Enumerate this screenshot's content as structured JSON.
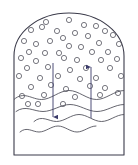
{
  "figure": {
    "title": "",
    "caption": "",
    "background_color": "#ffffff",
    "stroke_color": "#3b3b4a",
    "bubble_stroke_color": "#55555f",
    "wave_stroke_color": "#4a4a55",
    "arrow_color": "#3a3a6a"
  },
  "vessel": {
    "name": "vessel-outline",
    "label": "",
    "left_wall_x": 14,
    "right_wall_x": 124,
    "bottom_y": 155,
    "dome_top_y": 13,
    "dome_start_y": 56,
    "stroke_width": 1.1
  },
  "bubbles": {
    "label": "",
    "radius": 2.6,
    "count": 44,
    "points": [
      [
        46,
        22
      ],
      [
        69,
        20
      ],
      [
        84,
        25
      ],
      [
        96,
        26
      ],
      [
        31,
        30
      ],
      [
        57,
        31
      ],
      [
        75,
        33
      ],
      [
        105,
        31
      ],
      [
        42,
        27
      ],
      [
        63,
        38
      ],
      [
        88,
        36
      ],
      [
        113,
        35
      ],
      [
        24,
        41
      ],
      [
        36,
        44
      ],
      [
        50,
        41
      ],
      [
        99,
        43
      ],
      [
        69,
        46
      ],
      [
        81,
        47
      ],
      [
        119,
        44
      ],
      [
        29,
        52
      ],
      [
        45,
        53
      ],
      [
        59,
        53
      ],
      [
        92,
        52
      ],
      [
        108,
        52
      ],
      [
        21,
        58
      ],
      [
        36,
        61
      ],
      [
        64,
        58
      ],
      [
        77,
        60
      ],
      [
        101,
        60
      ],
      [
        117,
        59
      ],
      [
        27,
        68
      ],
      [
        48,
        67
      ],
      [
        70,
        70
      ],
      [
        86,
        68
      ],
      [
        110,
        68
      ],
      [
        19,
        76
      ],
      [
        40,
        78
      ],
      [
        58,
        76
      ],
      [
        80,
        79
      ],
      [
        96,
        78
      ],
      [
        121,
        76
      ],
      [
        31,
        87
      ],
      [
        51,
        85
      ],
      [
        66,
        89
      ],
      [
        90,
        86
      ],
      [
        105,
        88
      ],
      [
        22,
        96
      ],
      [
        44,
        95
      ],
      [
        75,
        97
      ],
      [
        100,
        95
      ],
      [
        118,
        93
      ],
      [
        28,
        104
      ],
      [
        38,
        104
      ],
      [
        63,
        104
      ]
    ]
  },
  "waves": {
    "label": "",
    "lines": [
      {
        "name": "liquid-surface-line-1",
        "y": 95,
        "amplitude": 4.5,
        "x_start": 14,
        "x_end": 124
      },
      {
        "name": "liquid-surface-line-2",
        "y": 108,
        "amplitude": 3.5,
        "x_start": 16,
        "x_end": 124
      },
      {
        "name": "liquid-surface-line-3",
        "y": 118,
        "amplitude": 3.5,
        "x_start": 34,
        "x_end": 124
      },
      {
        "name": "liquid-surface-line-4",
        "y": 129,
        "amplitude": 3.0,
        "x_start": 20,
        "x_end": 96
      }
    ]
  },
  "arrows": {
    "downflow": {
      "name": "downflow-arrow",
      "label": "",
      "direction": "down",
      "x": 53,
      "y_start": 63,
      "y_end": 122
    },
    "upflow": {
      "name": "upflow-arrow",
      "label": "",
      "direction": "up",
      "x": 91,
      "y_start": 118,
      "y_end": 62
    }
  }
}
